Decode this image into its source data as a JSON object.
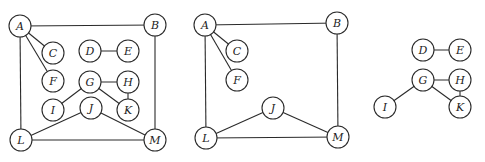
{
  "diagram": {
    "node_radius": 11,
    "graphs": [
      {
        "id": "graph-full",
        "nodes": [
          {
            "id": "A",
            "label": "A",
            "x": 20,
            "y": 26
          },
          {
            "id": "B",
            "label": "B",
            "x": 155,
            "y": 25
          },
          {
            "id": "C",
            "label": "C",
            "x": 53,
            "y": 53
          },
          {
            "id": "D",
            "label": "D",
            "x": 90,
            "y": 51
          },
          {
            "id": "E",
            "label": "E",
            "x": 128,
            "y": 51
          },
          {
            "id": "F",
            "label": "F",
            "x": 53,
            "y": 81
          },
          {
            "id": "G",
            "label": "G",
            "x": 90,
            "y": 82
          },
          {
            "id": "H",
            "label": "H",
            "x": 128,
            "y": 82
          },
          {
            "id": "I",
            "label": "I",
            "x": 53,
            "y": 110
          },
          {
            "id": "J",
            "label": "J",
            "x": 91,
            "y": 108
          },
          {
            "id": "K",
            "label": "K",
            "x": 128,
            "y": 110
          },
          {
            "id": "L",
            "label": "L",
            "x": 21,
            "y": 140
          },
          {
            "id": "M",
            "label": "M",
            "x": 155,
            "y": 140
          }
        ],
        "edges": [
          [
            "A",
            "B"
          ],
          [
            "A",
            "C"
          ],
          [
            "A",
            "F"
          ],
          [
            "A",
            "L"
          ],
          [
            "B",
            "M"
          ],
          [
            "L",
            "M"
          ],
          [
            "L",
            "J"
          ],
          [
            "J",
            "M"
          ],
          [
            "D",
            "E"
          ],
          [
            "G",
            "H"
          ],
          [
            "G",
            "I"
          ],
          [
            "G",
            "K"
          ],
          [
            "H",
            "K"
          ]
        ]
      },
      {
        "id": "graph-component-1",
        "nodes": [
          {
            "id": "A",
            "label": "A",
            "x": 205,
            "y": 25
          },
          {
            "id": "B",
            "label": "B",
            "x": 337,
            "y": 23
          },
          {
            "id": "C",
            "label": "C",
            "x": 237,
            "y": 51
          },
          {
            "id": "F",
            "label": "F",
            "x": 237,
            "y": 80
          },
          {
            "id": "J",
            "label": "J",
            "x": 273,
            "y": 108
          },
          {
            "id": "L",
            "label": "L",
            "x": 206,
            "y": 138
          },
          {
            "id": "M",
            "label": "M",
            "x": 338,
            "y": 137
          }
        ],
        "edges": [
          [
            "A",
            "B"
          ],
          [
            "A",
            "C"
          ],
          [
            "A",
            "F"
          ],
          [
            "A",
            "L"
          ],
          [
            "B",
            "M"
          ],
          [
            "L",
            "M"
          ],
          [
            "L",
            "J"
          ],
          [
            "J",
            "M"
          ]
        ]
      },
      {
        "id": "graph-components-2-3",
        "nodes": [
          {
            "id": "D",
            "label": "D",
            "x": 423,
            "y": 50
          },
          {
            "id": "E",
            "label": "E",
            "x": 460,
            "y": 50
          },
          {
            "id": "G",
            "label": "G",
            "x": 423,
            "y": 80
          },
          {
            "id": "H",
            "label": "H",
            "x": 460,
            "y": 80
          },
          {
            "id": "I",
            "label": "I",
            "x": 385,
            "y": 107
          },
          {
            "id": "K",
            "label": "K",
            "x": 460,
            "y": 107
          }
        ],
        "edges": [
          [
            "D",
            "E"
          ],
          [
            "G",
            "H"
          ],
          [
            "G",
            "I"
          ],
          [
            "G",
            "K"
          ],
          [
            "H",
            "K"
          ]
        ]
      }
    ]
  }
}
